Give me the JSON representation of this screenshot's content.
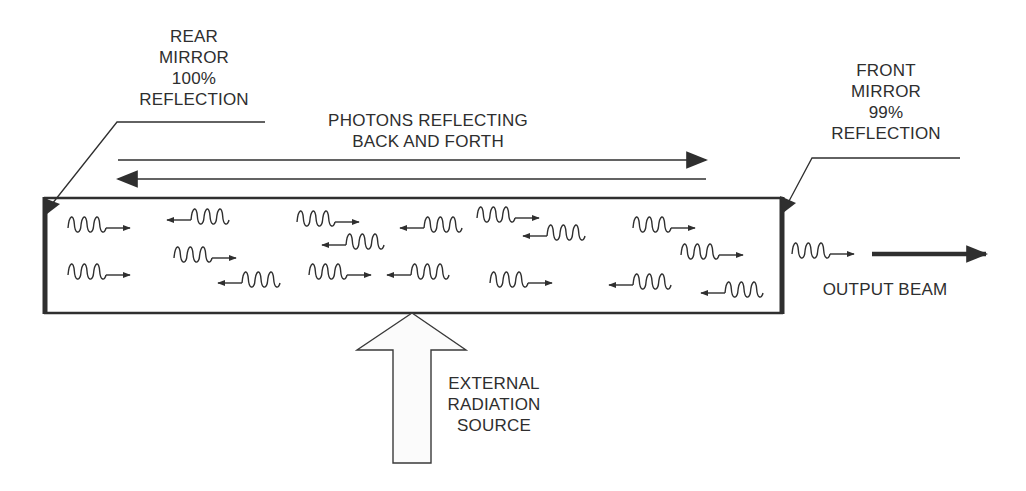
{
  "labels": {
    "rear_mirror": [
      "REAR",
      "MIRROR",
      "100%",
      "REFLECTION"
    ],
    "front_mirror": [
      "FRONT",
      "MIRROR",
      "99%",
      "REFLECTION"
    ],
    "photons": [
      "PHOTONS REFLECTING",
      "BACK AND FORTH"
    ],
    "output_beam": "OUTPUT BEAM",
    "external_source": [
      "EXTERNAL",
      "RADIATION",
      "SOURCE"
    ]
  },
  "colors": {
    "stroke": "#2f2f2f",
    "text": "#2e2e2e",
    "background": "#ffffff"
  },
  "photons": [
    {
      "x": 68,
      "y": 228,
      "dir": "right"
    },
    {
      "x": 68,
      "y": 275,
      "dir": "right"
    },
    {
      "x": 167,
      "y": 220,
      "dir": "left"
    },
    {
      "x": 174,
      "y": 258,
      "dir": "right"
    },
    {
      "x": 218,
      "y": 283,
      "dir": "left"
    },
    {
      "x": 297,
      "y": 222,
      "dir": "right"
    },
    {
      "x": 322,
      "y": 245,
      "dir": "left"
    },
    {
      "x": 309,
      "y": 275,
      "dir": "right"
    },
    {
      "x": 400,
      "y": 228,
      "dir": "left"
    },
    {
      "x": 387,
      "y": 275,
      "dir": "left"
    },
    {
      "x": 477,
      "y": 218,
      "dir": "right"
    },
    {
      "x": 523,
      "y": 236,
      "dir": "left"
    },
    {
      "x": 490,
      "y": 283,
      "dir": "right"
    },
    {
      "x": 633,
      "y": 228,
      "dir": "right"
    },
    {
      "x": 681,
      "y": 255,
      "dir": "right"
    },
    {
      "x": 609,
      "y": 285,
      "dir": "left"
    },
    {
      "x": 701,
      "y": 293,
      "dir": "left"
    },
    {
      "x": 792,
      "y": 254,
      "dir": "right"
    }
  ]
}
